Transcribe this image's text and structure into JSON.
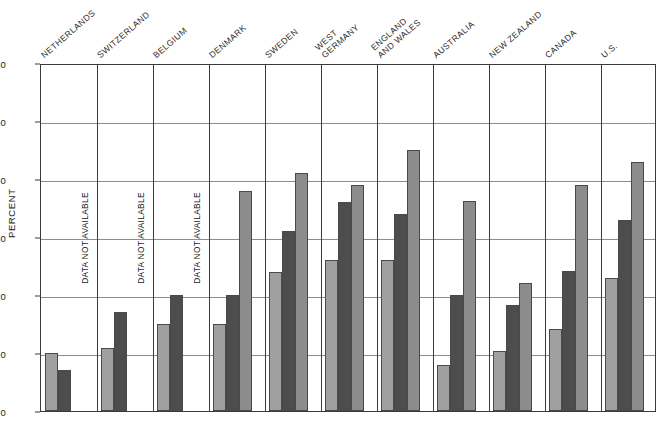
{
  "chart_data": {
    "type": "bar",
    "title": "",
    "xlabel": "",
    "ylabel": "PERCENT",
    "ylim": [
      0,
      60
    ],
    "yticks": [
      0,
      10,
      20,
      30,
      40,
      50,
      60
    ],
    "grid": true,
    "legend_position": "none",
    "na_label": "DATA NOT AVAILABLE",
    "categories": [
      "NETHERLANDS",
      "SWITZERLAND",
      "BELGIUM",
      "DENMARK",
      "SWEDEN",
      "WEST\nGERMANY",
      "ENGLAND\nAND WALES",
      "AUSTRALIA",
      "NEW ZEALAND",
      "CANADA",
      "U.S."
    ],
    "series": [
      {
        "name": "series-1",
        "color": "#a0a0a0",
        "values": [
          10,
          10.8,
          15,
          15,
          24,
          26,
          26,
          8,
          10.4,
          14.2,
          23
        ]
      },
      {
        "name": "series-2",
        "color": "#4d4d4d",
        "values": [
          7,
          17,
          20,
          20,
          31,
          36,
          34,
          20,
          18.2,
          24.2,
          33
        ]
      },
      {
        "name": "series-3",
        "color": "#8c8c8c",
        "values": [
          null,
          null,
          null,
          38,
          41,
          39,
          45,
          36.2,
          22,
          39,
          43
        ]
      }
    ]
  }
}
